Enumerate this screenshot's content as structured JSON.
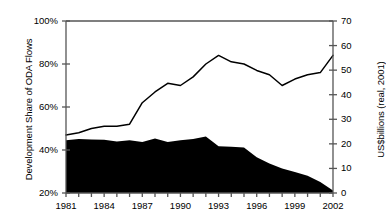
{
  "chart_data": {
    "type": "area",
    "title": "",
    "xlabel": "",
    "x": [
      1981,
      1982,
      1983,
      1984,
      1985,
      1986,
      1987,
      1988,
      1989,
      1990,
      1991,
      1992,
      1993,
      1994,
      1995,
      1996,
      1997,
      1998,
      1999,
      2000,
      2001,
      2002
    ],
    "xtick_labels": [
      "1981",
      "1984",
      "1987",
      "1990",
      "1993",
      "1996",
      "1999",
      "2002"
    ],
    "xtick_values": [
      1981,
      1984,
      1987,
      1990,
      1993,
      1996,
      1999,
      2002
    ],
    "xlim": [
      1981,
      2002
    ],
    "grid": false,
    "legend": "none",
    "series": [
      {
        "name": "Development Share of ODA Flows",
        "type": "line",
        "axis": "left",
        "unit": "%",
        "color": "#000000",
        "values": [
          47,
          48,
          50,
          51,
          51,
          52,
          62,
          67,
          71,
          70,
          74,
          80,
          84,
          81,
          80,
          77,
          75,
          70,
          73,
          75,
          76,
          84
        ]
      },
      {
        "name": "ODA Flows",
        "type": "area",
        "axis": "right",
        "unit": "US$billions (real, 2001)",
        "color": "#000000",
        "values": [
          21.5,
          22.0,
          21.8,
          21.7,
          21.0,
          21.5,
          20.8,
          22.2,
          20.8,
          21.5,
          22.0,
          23.0,
          19.0,
          18.8,
          18.5,
          14.5,
          12.0,
          10.0,
          8.5,
          7.0,
          4.5,
          1.0
        ]
      }
    ],
    "axes": {
      "left": {
        "label": "Development Share of ODA Flows",
        "ylim": [
          20,
          100
        ],
        "ticks": [
          20,
          40,
          60,
          80,
          100
        ],
        "tick_labels": [
          "20%",
          "40%",
          "60%",
          "80%",
          "100%"
        ]
      },
      "right": {
        "label": "US$billions (real, 2001)",
        "ylim": [
          0,
          70
        ],
        "ticks": [
          0,
          10,
          20,
          30,
          40,
          50,
          60,
          70
        ],
        "tick_labels": [
          "0",
          "10",
          "20",
          "30",
          "40",
          "50",
          "60",
          "70"
        ]
      }
    }
  }
}
